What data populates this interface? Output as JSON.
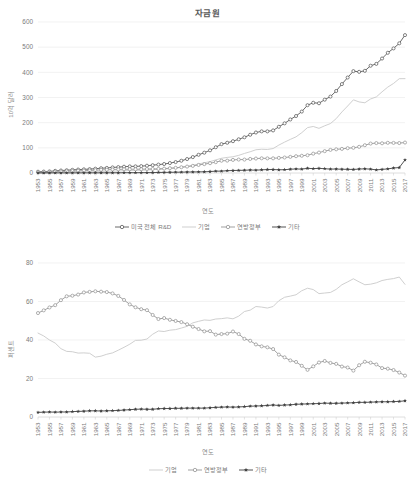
{
  "charts": [
    {
      "id": "top",
      "title": "자금원",
      "ylabel": "10억 달러",
      "xlabel": "연도",
      "legend": [
        {
          "label": "미국 전체 R&D",
          "key": "open-circle-dark"
        },
        {
          "label": "기업",
          "key": "line-light"
        },
        {
          "label": "연방정부",
          "key": "open-circle-mid"
        },
        {
          "label": "기타",
          "key": "filled-star-dark"
        }
      ]
    },
    {
      "id": "bottom",
      "title": "",
      "ylabel": "퍼센트",
      "xlabel": "연도",
      "legend": [
        {
          "label": "기업",
          "key": "line-light"
        },
        {
          "label": "연방정부",
          "key": "open-circle-mid"
        },
        {
          "label": "기타",
          "key": "filled-star-dark"
        }
      ]
    }
  ],
  "colors": {
    "total_rd": "#595959",
    "business": "#c9c9c9",
    "federal": "#969696",
    "other": "#404040",
    "grid": "#ececec",
    "text": "#7b7b7b"
  },
  "chart_data": [
    {
      "type": "line",
      "title": "자금원",
      "xlabel": "연도",
      "ylabel": "10억 달러",
      "ylim": [
        0,
        600
      ],
      "yticks": [
        0,
        100,
        200,
        300,
        400,
        500,
        600
      ],
      "grid": true,
      "legend_position": "bottom",
      "x": [
        1953,
        1954,
        1955,
        1956,
        1957,
        1958,
        1959,
        1960,
        1961,
        1962,
        1963,
        1964,
        1965,
        1966,
        1967,
        1968,
        1969,
        1970,
        1971,
        1972,
        1973,
        1974,
        1975,
        1976,
        1977,
        1978,
        1979,
        1980,
        1981,
        1982,
        1983,
        1984,
        1985,
        1986,
        1987,
        1988,
        1989,
        1990,
        1991,
        1992,
        1993,
        1994,
        1995,
        1996,
        1997,
        1998,
        1999,
        2000,
        2001,
        2002,
        2003,
        2004,
        2005,
        2006,
        2007,
        2008,
        2009,
        2010,
        2011,
        2012,
        2013,
        2014,
        2015,
        2016,
        2017
      ],
      "xtick_labels": [
        "1953",
        "1955",
        "1957",
        "1959",
        "1961",
        "1963",
        "1965",
        "1967",
        "1969",
        "1971",
        "1973",
        "1975",
        "1977",
        "1979",
        "1981",
        "1983",
        "1985",
        "1987",
        "1989",
        "1991",
        "1993",
        "1995",
        "1997",
        "1999",
        "2001",
        "2003",
        "2005",
        "2007",
        "2009",
        "2011",
        "2013",
        "2015",
        "2017"
      ],
      "series": [
        {
          "name": "미국 전체 R&D",
          "marker": "open-circle",
          "color": "#595959",
          "values": [
            5.1,
            5.6,
            6.3,
            8.5,
            9.9,
            10.9,
            12.5,
            13.7,
            14.5,
            15.4,
            17.1,
            18.9,
            20.1,
            22.1,
            23.4,
            25.0,
            26.2,
            26.3,
            27.3,
            29.0,
            31.0,
            33.4,
            35.7,
            39.4,
            43.4,
            48.7,
            55.4,
            63.2,
            72.3,
            80.7,
            90.1,
            102.3,
            114.7,
            120.2,
            126.4,
            133.9,
            141.9,
            152.0,
            160.9,
            165.4,
            165.4,
            169.2,
            183.6,
            197.3,
            212.7,
            226.4,
            244.1,
            269.5,
            279.1,
            277.1,
            291.4,
            303.7,
            325.9,
            353.3,
            379.4,
            404.8,
            402.0,
            406.0,
            426.2,
            433.6,
            454.9,
            477.7,
            495.1,
            515.3,
            547.9
          ]
        },
        {
          "name": "기업",
          "marker": "none",
          "color": "#c9c9c9",
          "values": [
            2.2,
            2.4,
            2.5,
            3.3,
            3.7,
            3.9,
            4.4,
            4.5,
            4.6,
            4.8,
            5.3,
            5.9,
            6.5,
            7.3,
            8.1,
            9.0,
            9.9,
            10.4,
            10.8,
            11.7,
            13.3,
            14.9,
            15.8,
            17.7,
            19.7,
            22.5,
            26.1,
            30.9,
            35.9,
            40.7,
            45.3,
            52.1,
            58.6,
            61.9,
            64.5,
            70.1,
            77.7,
            84.4,
            92.3,
            94.4,
            93.6,
            97.1,
            110.9,
            122.7,
            133.6,
            143.7,
            160.2,
            180.4,
            184.9,
            177.5,
            187.6,
            196.5,
            216.0,
            242.6,
            266.2,
            290.7,
            282.4,
            279.0,
            294.1,
            302.3,
            322.5,
            341.4,
            355.8,
            374.7,
            375.0
          ]
        },
        {
          "name": "연방정부",
          "marker": "open-circle",
          "color": "#969696",
          "values": [
            2.7,
            3.0,
            3.5,
            4.9,
            5.9,
            6.7,
            7.7,
            8.7,
            9.4,
            10.0,
            11.2,
            12.4,
            12.9,
            14.0,
            14.4,
            14.9,
            15.0,
            14.8,
            15.1,
            15.9,
            16.0,
            16.4,
            17.5,
            19.0,
            20.6,
            22.9,
            25.5,
            28.3,
            32.0,
            35.3,
            38.9,
            43.0,
            48.7,
            49.2,
            52.0,
            53.4,
            53.3,
            55.8,
            57.4,
            58.4,
            58.1,
            58.3,
            60.0,
            61.5,
            64.1,
            66.7,
            68.5,
            70.6,
            76.9,
            81.2,
            86.8,
            91.8,
            94.1,
            95.8,
            98.6,
            100.1,
            104.0,
            110.4,
            116.9,
            118.9,
            118.0,
            120.0,
            119.6,
            119.0,
            121.0
          ]
        },
        {
          "name": "기타",
          "marker": "filled-star",
          "color": "#404040",
          "values": [
            0.2,
            0.2,
            0.3,
            0.3,
            0.3,
            0.3,
            0.4,
            0.5,
            0.5,
            0.6,
            0.6,
            0.6,
            0.7,
            0.8,
            0.9,
            1.1,
            1.3,
            1.1,
            1.4,
            1.4,
            1.7,
            2.1,
            2.4,
            2.7,
            3.1,
            3.3,
            3.8,
            4.0,
            4.4,
            4.7,
            5.9,
            7.2,
            7.4,
            9.1,
            9.9,
            10.4,
            10.9,
            11.8,
            11.2,
            12.6,
            13.7,
            13.8,
            12.7,
            13.1,
            15.0,
            16.0,
            15.4,
            18.5,
            17.3,
            18.4,
            17.0,
            15.4,
            15.8,
            14.9,
            14.6,
            14.0,
            15.6,
            16.6,
            15.2,
            12.4,
            14.4,
            16.3,
            19.7,
            21.6,
            51.9
          ]
        }
      ]
    },
    {
      "type": "line",
      "title": "",
      "xlabel": "연도",
      "ylabel": "퍼센트",
      "ylim": [
        0,
        80
      ],
      "yticks": [
        0,
        20,
        40,
        60,
        80
      ],
      "grid": true,
      "legend_position": "bottom",
      "x": [
        1953,
        1954,
        1955,
        1956,
        1957,
        1958,
        1959,
        1960,
        1961,
        1962,
        1963,
        1964,
        1965,
        1966,
        1967,
        1968,
        1969,
        1970,
        1971,
        1972,
        1973,
        1974,
        1975,
        1976,
        1977,
        1978,
        1979,
        1980,
        1981,
        1982,
        1983,
        1984,
        1985,
        1986,
        1987,
        1988,
        1989,
        1990,
        1991,
        1992,
        1993,
        1994,
        1995,
        1996,
        1997,
        1998,
        1999,
        2000,
        2001,
        2002,
        2003,
        2004,
        2005,
        2006,
        2007,
        2008,
        2009,
        2010,
        2011,
        2012,
        2013,
        2014,
        2015,
        2016,
        2017
      ],
      "xtick_labels": [
        "1953",
        "1955",
        "1957",
        "1959",
        "1961",
        "1963",
        "1965",
        "1967",
        "1969",
        "1971",
        "1973",
        "1975",
        "1977",
        "1979",
        "1981",
        "1983",
        "1985",
        "1987",
        "1989",
        "1991",
        "1993",
        "1995",
        "1997",
        "1999",
        "2001",
        "2003",
        "2005",
        "2007",
        "2009",
        "2011",
        "2013",
        "2015",
        "2017"
      ],
      "series": [
        {
          "name": "기업",
          "marker": "none",
          "color": "#c9c9c9",
          "values": [
            43.6,
            42.1,
            40.0,
            38.4,
            35.5,
            34.1,
            33.9,
            33.2,
            33.3,
            33.1,
            31.1,
            31.6,
            32.6,
            33.3,
            34.7,
            36.2,
            37.8,
            39.8,
            39.9,
            40.5,
            43.0,
            44.7,
            44.4,
            45.1,
            45.4,
            46.2,
            47.1,
            48.9,
            49.7,
            50.4,
            50.2,
            50.9,
            51.1,
            51.5,
            51.0,
            52.4,
            54.8,
            55.5,
            57.4,
            57.1,
            56.6,
            57.4,
            60.4,
            62.2,
            62.8,
            63.5,
            65.6,
            66.9,
            66.2,
            64.1,
            64.4,
            64.7,
            66.3,
            68.7,
            70.2,
            71.8,
            70.2,
            68.7,
            69.0,
            69.7,
            70.9,
            71.5,
            71.9,
            72.7,
            68.9
          ]
        },
        {
          "name": "연방정부",
          "marker": "open-circle",
          "color": "#969696",
          "values": [
            54.0,
            55.4,
            56.9,
            58.1,
            60.7,
            62.7,
            63.0,
            63.6,
            64.7,
            65.0,
            65.3,
            65.1,
            64.9,
            64.2,
            62.9,
            60.8,
            58.5,
            57.0,
            56.0,
            55.5,
            53.0,
            50.9,
            51.4,
            50.5,
            49.9,
            49.3,
            48.2,
            46.9,
            45.7,
            44.5,
            44.6,
            42.8,
            43.1,
            43.3,
            44.4,
            43.1,
            40.6,
            39.6,
            37.7,
            36.7,
            36.2,
            35.3,
            32.4,
            31.0,
            29.4,
            28.6,
            26.6,
            24.5,
            26.3,
            28.3,
            29.1,
            28.1,
            27.6,
            26.2,
            25.7,
            24.1,
            26.9,
            28.7,
            28.2,
            27.3,
            25.4,
            25.1,
            24.4,
            23.1,
            21.5
          ]
        },
        {
          "name": "기타",
          "marker": "filled-star",
          "color": "#404040",
          "values": [
            2.4,
            2.5,
            2.6,
            2.5,
            2.6,
            2.6,
            2.8,
            2.9,
            3.0,
            3.2,
            3.2,
            3.1,
            3.2,
            3.3,
            3.4,
            3.6,
            3.8,
            4.0,
            4.1,
            4.0,
            4.0,
            4.3,
            4.4,
            4.4,
            4.5,
            4.5,
            4.6,
            4.6,
            4.6,
            4.6,
            4.8,
            5.0,
            5.1,
            5.2,
            5.1,
            5.2,
            5.4,
            5.6,
            5.7,
            5.8,
            6.0,
            6.2,
            6.0,
            6.2,
            6.3,
            6.6,
            6.7,
            6.8,
            6.9,
            7.0,
            7.2,
            7.1,
            7.1,
            7.2,
            7.3,
            7.4,
            7.6,
            7.6,
            7.7,
            7.8,
            7.9,
            7.9,
            8.0,
            8.1,
            8.4
          ]
        }
      ]
    }
  ]
}
